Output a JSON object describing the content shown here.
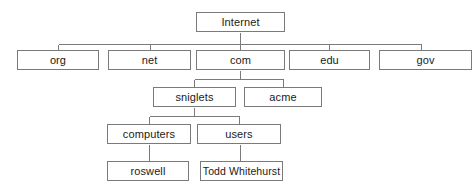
{
  "diagram": {
    "type": "tree-diagram",
    "background_color": "#ffffff",
    "box_fill_color": "#ffffff",
    "box_border_color": "#7a7a7a",
    "edge_color": "#7a7a7a",
    "text_color": "#1a1a1a",
    "levels": 5,
    "nodes": {
      "internet": {
        "label": "Internet",
        "level": 0,
        "x": 196,
        "y": 12,
        "w": 89,
        "h": 20
      },
      "org": {
        "label": "org",
        "level": 1,
        "x": 17,
        "y": 50,
        "w": 82,
        "h": 20
      },
      "net": {
        "label": "net",
        "level": 1,
        "x": 108,
        "y": 50,
        "w": 83,
        "h": 20
      },
      "com": {
        "label": "com",
        "level": 1,
        "x": 196,
        "y": 50,
        "w": 89,
        "h": 20
      },
      "edu": {
        "label": "edu",
        "level": 1,
        "x": 289,
        "y": 50,
        "w": 81,
        "h": 20
      },
      "gov": {
        "label": "gov",
        "level": 1,
        "x": 379,
        "y": 50,
        "w": 93,
        "h": 20
      },
      "sniglets": {
        "label": "sniglets",
        "level": 2,
        "x": 153,
        "y": 87,
        "w": 83,
        "h": 20
      },
      "acme": {
        "label": "acme",
        "level": 2,
        "x": 244,
        "y": 87,
        "w": 78,
        "h": 20
      },
      "computers": {
        "label": "computers",
        "level": 3,
        "x": 107,
        "y": 124,
        "w": 84,
        "h": 20
      },
      "users": {
        "label": "users",
        "level": 3,
        "x": 197,
        "y": 124,
        "w": 84,
        "h": 20
      },
      "roswell": {
        "label": "roswell",
        "level": 4,
        "x": 107,
        "y": 161,
        "w": 82,
        "h": 20
      },
      "todd": {
        "label": "Todd Whitehurst",
        "level": 4,
        "x": 200,
        "y": 161,
        "w": 83,
        "h": 20
      }
    },
    "edges": [
      {
        "from": "internet",
        "to": "org",
        "style": "elbow"
      },
      {
        "from": "internet",
        "to": "net",
        "style": "elbow"
      },
      {
        "from": "internet",
        "to": "com",
        "style": "straight"
      },
      {
        "from": "internet",
        "to": "edu",
        "style": "elbow"
      },
      {
        "from": "internet",
        "to": "gov",
        "style": "elbow"
      },
      {
        "from": "com",
        "to": "sniglets",
        "style": "elbow"
      },
      {
        "from": "com",
        "to": "acme",
        "style": "elbow"
      },
      {
        "from": "sniglets",
        "to": "computers",
        "style": "elbow"
      },
      {
        "from": "sniglets",
        "to": "users",
        "style": "elbow"
      },
      {
        "from": "computers",
        "to": "roswell",
        "style": "straight"
      },
      {
        "from": "users",
        "to": "todd",
        "style": "straight"
      }
    ],
    "bus_lines": [
      {
        "name": "level1-bus",
        "y": 44,
        "x1": 58,
        "x2": 421,
        "stub_xs": [
          58,
          150,
          240,
          329,
          421
        ],
        "parent_x": 240
      },
      {
        "name": "level2-bus",
        "y": 79,
        "x1": 194,
        "x2": 283,
        "stub_xs": [
          194,
          283
        ],
        "parent_x": 240
      },
      {
        "name": "level3-bus",
        "y": 116,
        "x1": 149,
        "x2": 239,
        "stub_xs": [
          149,
          239
        ],
        "parent_x": 194
      }
    ]
  }
}
